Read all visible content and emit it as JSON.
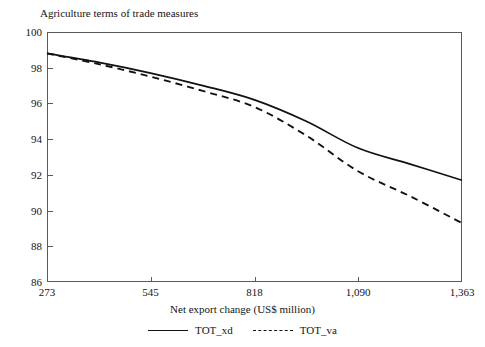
{
  "chart_data": {
    "type": "line",
    "title": "Agriculture terms of trade measures",
    "xlabel": "Net export change (US$ million)",
    "ylabel": "",
    "grid": false,
    "legend_position": "bottom",
    "xlim": [
      273,
      1363
    ],
    "ylim": [
      86,
      100
    ],
    "x_ticks": [
      273,
      545,
      818,
      1090,
      1363
    ],
    "x_tick_labels": [
      "273",
      "545",
      "818",
      "1,090",
      "1,363"
    ],
    "y_ticks": [
      86,
      88,
      90,
      92,
      94,
      96,
      98,
      100
    ],
    "y_tick_labels": [
      "86",
      "88",
      "90",
      "92",
      "94",
      "96",
      "98",
      "100"
    ],
    "x": [
      273,
      409,
      545,
      682,
      818,
      954,
      1090,
      1227,
      1363
    ],
    "series": [
      {
        "name": "TOT_xd",
        "style": "solid",
        "color": "#111111",
        "values": [
          98.8,
          98.3,
          97.7,
          97.0,
          96.2,
          95.0,
          93.5,
          92.6,
          91.7
        ]
      },
      {
        "name": "TOT_va",
        "style": "dashed",
        "color": "#111111",
        "values": [
          98.8,
          98.2,
          97.5,
          96.7,
          95.8,
          94.2,
          92.2,
          90.8,
          89.3
        ]
      }
    ]
  },
  "legend": [
    {
      "label": "TOT_xd",
      "style": "solid"
    },
    {
      "label": "TOT_va",
      "style": "dashed"
    }
  ]
}
